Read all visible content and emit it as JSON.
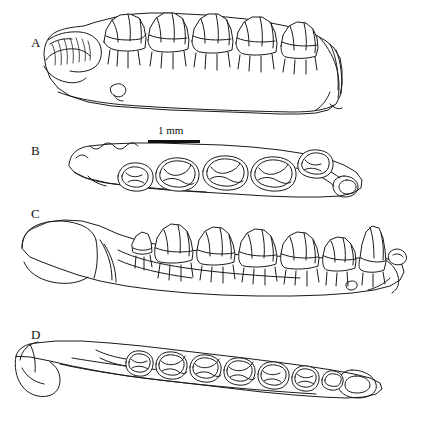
{
  "figure": {
    "type": "line-drawing-plate",
    "background_color": "#ffffff",
    "ink_color": "#1a1a1a",
    "panels": [
      {
        "id": "A",
        "label": "A",
        "view": "lateral-left",
        "teeth_count": 5
      },
      {
        "id": "B",
        "label": "B",
        "view": "occlusal",
        "teeth_count": 5
      },
      {
        "id": "C",
        "label": "C",
        "view": "lateral-left",
        "teeth_count": 6
      },
      {
        "id": "D",
        "label": "D",
        "view": "occlusal",
        "teeth_count": 7
      }
    ],
    "scale_bar": {
      "label": "1 mm",
      "length_px": 52
    }
  }
}
